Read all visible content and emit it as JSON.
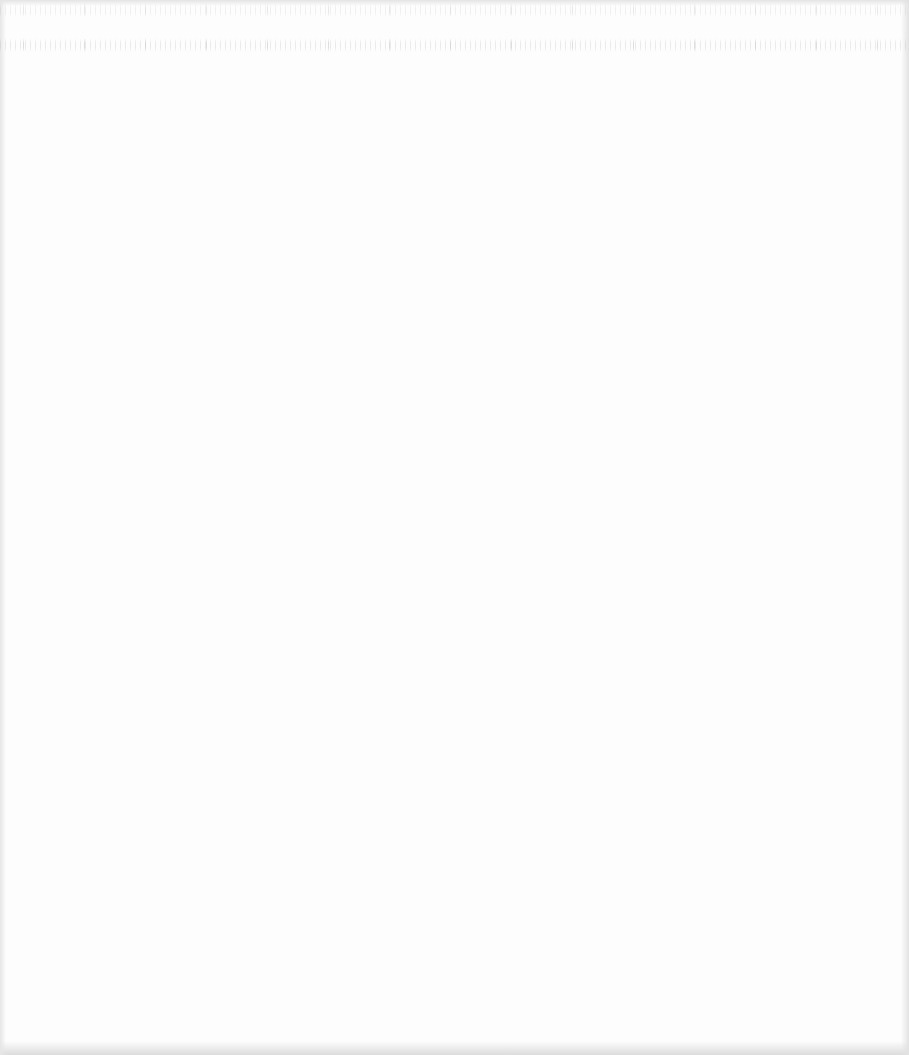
{
  "page": {
    "type": "blank scanned page",
    "background_color": "#fdfdfd",
    "edge_shade_color": "#dcdcdc",
    "ghost_text_color": "#969696",
    "ghost_text_rows": [
      {
        "row": 1,
        "approx_top_px": 3,
        "legible": false,
        "text": ""
      },
      {
        "row": 2,
        "approx_top_px": 38,
        "legible": false,
        "text": ""
      }
    ]
  }
}
